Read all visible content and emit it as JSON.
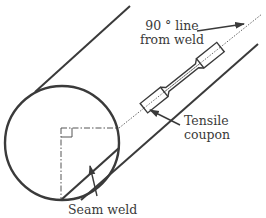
{
  "diagram": {
    "colors": {
      "stroke": "#3a3a3a",
      "background": "#ffffff"
    },
    "labels": {
      "line_90": {
        "line1": "90 ° line",
        "line2": "from weld"
      },
      "coupon": {
        "line1": "Tensile",
        "line2": "coupon"
      },
      "seam": {
        "text": "Seam weld"
      }
    },
    "components": [
      "pipe-cross-section-circle",
      "pipe-upper-edge",
      "pipe-lower-edge",
      "seam-weld-chord",
      "centerline-vertical",
      "centerline-horizontal",
      "right-angle-marker",
      "90-degree-dotted-line",
      "tensile-coupon",
      "arrow-90-line",
      "arrow-coupon",
      "arrow-seam-weld"
    ]
  }
}
